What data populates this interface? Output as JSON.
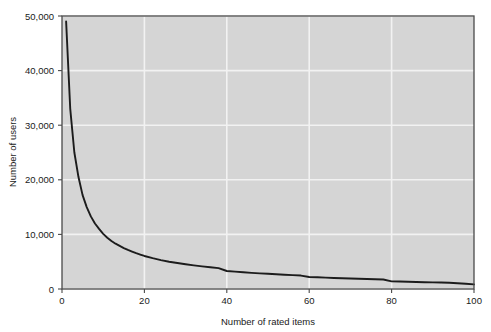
{
  "figure": {
    "background_color": "#ffffff",
    "plot_background_color": "#d5d5d5",
    "grid_color": "#f2f2f2",
    "border_color": "#4a4a4a",
    "line_color": "#1c1c1c"
  },
  "chart_data": {
    "type": "line",
    "title": "",
    "subtitle": "",
    "xlabel": "Number of rated items",
    "ylabel": "Number of users",
    "xlim": [
      0,
      100
    ],
    "ylim": [
      0,
      50000
    ],
    "grid": true,
    "legend": null,
    "legend_position": "none",
    "xticks": [
      0,
      20,
      40,
      60,
      80,
      100
    ],
    "xtick_labels": [
      "0",
      "20",
      "40",
      "60",
      "80",
      "100"
    ],
    "yticks": [
      0,
      10000,
      20000,
      30000,
      40000,
      50000
    ],
    "ytick_labels": [
      "0",
      "10,000",
      "20,000",
      "30,000",
      "40,000",
      "50,000"
    ],
    "annotations": [],
    "series": [
      {
        "name": "users per number of rated items",
        "x": [
          1,
          2,
          3,
          4,
          5,
          6,
          7,
          8,
          9,
          10,
          11,
          12,
          13,
          14,
          15,
          16,
          17,
          18,
          19,
          20,
          22,
          24,
          26,
          28,
          30,
          32,
          34,
          36,
          38,
          40,
          42,
          44,
          46,
          48,
          50,
          52,
          54,
          56,
          58,
          60,
          62,
          64,
          66,
          68,
          70,
          72,
          74,
          76,
          78,
          80,
          82,
          84,
          86,
          88,
          90,
          92,
          94,
          96,
          98,
          100
        ],
        "values": [
          49000,
          33000,
          25000,
          20500,
          17200,
          15000,
          13300,
          12000,
          11000,
          10100,
          9400,
          8800,
          8300,
          7900,
          7500,
          7150,
          6850,
          6560,
          6300,
          6050,
          5650,
          5300,
          5000,
          4750,
          4530,
          4330,
          4150,
          3980,
          3830,
          3300,
          3180,
          3070,
          2960,
          2870,
          2780,
          2690,
          2610,
          2540,
          2460,
          2200,
          2140,
          2080,
          2020,
          1970,
          1920,
          1870,
          1820,
          1780,
          1740,
          1400,
          1360,
          1320,
          1280,
          1250,
          1210,
          1180,
          1140,
          1050,
          950,
          850
        ]
      }
    ]
  }
}
